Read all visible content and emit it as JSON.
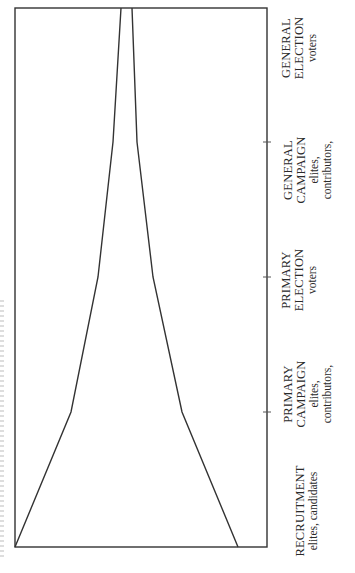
{
  "diagram": {
    "type": "funnel",
    "orientation": "rotated-90-ccw",
    "frame": {
      "left": 15,
      "top": 8,
      "right": 267,
      "bottom": 547
    },
    "stroke_color": "#333333",
    "funnel_left_edge": [
      [
        15,
        547
      ],
      [
        71,
        412
      ],
      [
        98,
        277
      ],
      [
        113,
        142
      ],
      [
        121,
        8
      ]
    ],
    "funnel_right_edge": [
      [
        238,
        547
      ],
      [
        182,
        412
      ],
      [
        153,
        277
      ],
      [
        137,
        142
      ],
      [
        132,
        8
      ]
    ],
    "tick_positions_y": [
      142,
      277,
      412
    ],
    "stages": [
      {
        "title_lines": [
          "RECRUITMENT"
        ],
        "sub_lines": [
          "elites, candidates"
        ],
        "center_y": 510
      },
      {
        "title_lines": [
          "PRIMARY",
          "CAMPAIGN"
        ],
        "sub_lines": [
          "elites,",
          "contributors,"
        ],
        "center_y": 393
      },
      {
        "title_lines": [
          "PRIMARY",
          "ELECTION"
        ],
        "sub_lines": [
          "voters"
        ],
        "center_y": 280
      },
      {
        "title_lines": [
          "GENERAL",
          "CAMPAIGN"
        ],
        "sub_lines": [
          "elites,",
          "contributors,"
        ],
        "center_y": 170
      },
      {
        "title_lines": [
          "GENERAL",
          "ELECTION"
        ],
        "sub_lines": [
          "voters"
        ],
        "center_y": 48
      }
    ]
  },
  "labels": {
    "s0_t0": "RECRUITMENT",
    "s0_s0": "elites, candidates",
    "s1_t0": "PRIMARY",
    "s1_t1": "CAMPAIGN",
    "s1_s0": "elites,",
    "s1_s1": "contributors,",
    "s2_t0": "PRIMARY",
    "s2_t1": "ELECTION",
    "s2_s0": "voters",
    "s3_t0": "GENERAL",
    "s3_t1": "CAMPAIGN",
    "s3_s0": "elites,",
    "s3_s1": "contributors,",
    "s4_t0": "GENERAL",
    "s4_t1": "ELECTION",
    "s4_s0": "voters"
  }
}
